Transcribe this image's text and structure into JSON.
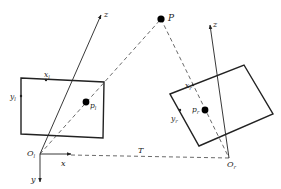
{
  "diagram": {
    "type": "stereo-camera-geometry",
    "colors": {
      "line": "#222222",
      "dashed": "#444444",
      "point": "#000000",
      "background": "#ffffff"
    },
    "world_point": {
      "label": "P"
    },
    "left_camera": {
      "origin_label": "O",
      "origin_sub": "l",
      "axis_x_label": "x",
      "axis_y_label": "y",
      "axis_z_label": "z",
      "image_x_label": "x",
      "image_x_sub": "l",
      "image_y_label": "y",
      "image_y_sub": "l",
      "projection_label": "p",
      "projection_sub": "l"
    },
    "right_camera": {
      "origin_label": "O",
      "origin_sub": "r",
      "axis_z_label": "z",
      "image_x_label": "x",
      "image_x_sub": "r",
      "image_y_label": "y",
      "image_y_sub": "r",
      "projection_label": "p",
      "projection_sub": "r"
    },
    "baseline_label": "T"
  }
}
